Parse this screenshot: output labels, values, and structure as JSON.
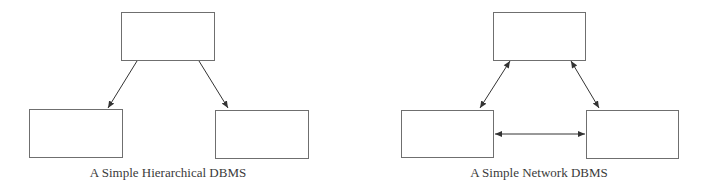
{
  "diagrams": [
    {
      "id": "hierarchical",
      "caption": "A Simple Hierarchical DBMS",
      "caption_pos": {
        "x": 168,
        "y": 165
      },
      "nodes": [
        {
          "id": "root",
          "x": 121,
          "y": 12,
          "w": 94,
          "h": 49
        },
        {
          "id": "child-left",
          "x": 29,
          "y": 109,
          "w": 94,
          "h": 49
        },
        {
          "id": "child-right",
          "x": 215,
          "y": 110,
          "w": 94,
          "h": 49
        }
      ],
      "edges": [
        {
          "from": "root",
          "to": "child-left",
          "x1": 137,
          "y1": 61,
          "x2": 108,
          "y2": 108,
          "arrow": "end"
        },
        {
          "from": "root",
          "to": "child-right",
          "x1": 199,
          "y1": 61,
          "x2": 228,
          "y2": 108,
          "arrow": "end"
        }
      ]
    },
    {
      "id": "network",
      "caption": "A Simple Network DBMS",
      "caption_pos": {
        "x": 539,
        "y": 165
      },
      "nodes": [
        {
          "id": "top",
          "x": 493,
          "y": 12,
          "w": 93,
          "h": 49
        },
        {
          "id": "bottom-left",
          "x": 401,
          "y": 110,
          "w": 93,
          "h": 48
        },
        {
          "id": "bottom-right",
          "x": 586,
          "y": 110,
          "w": 93,
          "h": 49
        }
      ],
      "edges": [
        {
          "from": "top",
          "to": "bottom-left",
          "x1": 510,
          "y1": 61,
          "x2": 480,
          "y2": 108,
          "arrow": "both"
        },
        {
          "from": "top",
          "to": "bottom-right",
          "x1": 571,
          "y1": 61,
          "x2": 599,
          "y2": 108,
          "arrow": "both"
        },
        {
          "from": "bottom-left",
          "to": "bottom-right",
          "x1": 495,
          "y1": 134,
          "x2": 585,
          "y2": 134,
          "arrow": "both"
        }
      ]
    }
  ],
  "colors": {
    "stroke": "#6f6f6f",
    "arrow": "#333333",
    "text": "#3a3a3a",
    "background": "#ffffff"
  }
}
